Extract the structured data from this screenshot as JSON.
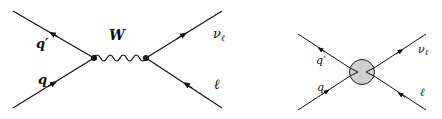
{
  "diagram_left": {
    "title": "W exchange",
    "labels": {
      "q_prime": "q′",
      "q": "q",
      "boson": "W",
      "neutrino": "ν",
      "neutrino_sub": "ℓ",
      "lepton": "ℓ"
    }
  },
  "diagram_right": {
    "title": "effective contact interaction",
    "labels": {
      "q_prime": "q′",
      "q": "q",
      "neutrino": "ν",
      "neutrino_sub": "ℓ",
      "lepton": "ℓ"
    },
    "blob_color": "#cfcfcf"
  },
  "colors": {
    "line": "#111111",
    "background": "#ffffff"
  }
}
